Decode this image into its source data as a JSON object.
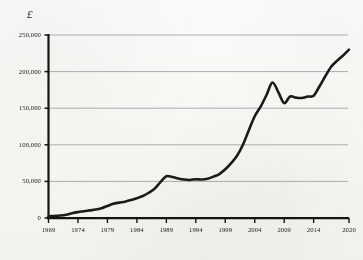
{
  "chart_data": {
    "type": "line",
    "title": "",
    "subtitle": "",
    "xlabel": "",
    "ylabel": "",
    "unit_symbol": "£",
    "xlim": [
      1969,
      2020
    ],
    "ylim": [
      0,
      250000
    ],
    "grid": "horizontal",
    "legend": "none",
    "line_color": "#1a1a1a",
    "grid_color": "#9e9e9e",
    "axis_color": "#141414",
    "background_color": "#fbfaf8",
    "ytick_labels": [
      "0",
      "50,000",
      "100,000",
      "150,000",
      "200,000",
      "250,000"
    ],
    "ytick_values": [
      0,
      50000,
      100000,
      150000,
      200000,
      250000
    ],
    "xtick_labels": [
      "1969",
      "1974",
      "1979",
      "1984",
      "1989",
      "1994",
      "1999",
      "2004",
      "2009",
      "2014",
      "2020"
    ],
    "xtick_values": [
      1969,
      1974,
      1979,
      1984,
      1989,
      1994,
      1999,
      2004,
      2009,
      2014,
      2020
    ],
    "series": [
      {
        "name": "Average house price",
        "x": [
          1969,
          1970,
          1971,
          1972,
          1973,
          1974,
          1975,
          1976,
          1977,
          1978,
          1979,
          1980,
          1981,
          1982,
          1983,
          1984,
          1985,
          1986,
          1987,
          1988,
          1989,
          1990,
          1991,
          1992,
          1993,
          1994,
          1995,
          1996,
          1997,
          1998,
          1999,
          2000,
          2001,
          2002,
          2003,
          2004,
          2005,
          2006,
          2007,
          2008,
          2009,
          2010,
          2011,
          2012,
          2013,
          2014,
          2015,
          2016,
          2017,
          2018,
          2019,
          2020
        ],
        "values": [
          2200,
          2800,
          3400,
          4500,
          6500,
          8000,
          9200,
          10400,
          11500,
          13400,
          16500,
          19500,
          21000,
          22300,
          24500,
          27000,
          30000,
          34500,
          40000,
          49000,
          57000,
          56000,
          54000,
          52500,
          52000,
          53000,
          52500,
          53500,
          56500,
          60000,
          66500,
          75000,
          85000,
          100000,
          120000,
          139000,
          152000,
          168000,
          185000,
          172000,
          157000,
          166000,
          164500,
          164000,
          166000,
          167000,
          180000,
          194000,
          207000,
          215000,
          222000,
          230000
        ]
      }
    ],
    "annotations": []
  },
  "axis_unit_label": "£"
}
